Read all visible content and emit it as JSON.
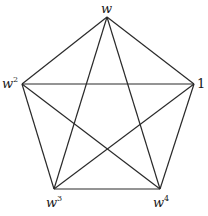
{
  "diagram": {
    "title": "",
    "type": "complete-graph-K5",
    "vertices": [
      {
        "id": "top",
        "label": "w",
        "exponent": "",
        "x": 107,
        "y": 17,
        "lx": 101,
        "ly": 13
      },
      {
        "id": "left",
        "label": "w",
        "exponent": "2",
        "x": 22,
        "y": 84,
        "lx": 2,
        "ly": 88
      },
      {
        "id": "right",
        "label": "1",
        "exponent": "",
        "x": 194,
        "y": 84,
        "lx": 197,
        "ly": 88
      },
      {
        "id": "bottom-left",
        "label": "w",
        "exponent": "3",
        "x": 54,
        "y": 189,
        "lx": 46,
        "ly": 207
      },
      {
        "id": "bottom-right",
        "label": "w",
        "exponent": "4",
        "x": 160,
        "y": 189,
        "lx": 153,
        "ly": 207
      }
    ],
    "edges": [
      [
        "top",
        "left"
      ],
      [
        "top",
        "right"
      ],
      [
        "top",
        "bottom-left"
      ],
      [
        "top",
        "bottom-right"
      ],
      [
        "left",
        "right"
      ],
      [
        "left",
        "bottom-left"
      ],
      [
        "left",
        "bottom-right"
      ],
      [
        "right",
        "bottom-left"
      ],
      [
        "right",
        "bottom-right"
      ],
      [
        "bottom-left",
        "bottom-right"
      ]
    ],
    "colors": {
      "line": "#2a2a2a",
      "text": "#1a1a1a",
      "background": "#ffffff"
    }
  }
}
